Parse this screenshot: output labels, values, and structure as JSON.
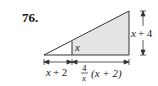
{
  "problem_number": "76.",
  "labels": {
    "inner_height": "x",
    "outer_height_var": "x",
    "outer_height_op": "+ 4",
    "bottom_left_var": "x",
    "bottom_left_op": "+ 2",
    "bottom_right_frac_num": "4",
    "bottom_right_frac_den": "x",
    "bottom_right_expr": "(x + 2)"
  },
  "colors": {
    "shade": "#e4e4e4",
    "stroke": "#333333"
  }
}
